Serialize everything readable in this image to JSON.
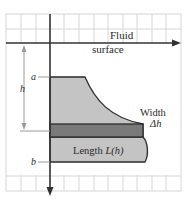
{
  "diagram": {
    "surface_label_line1": "Fluid",
    "surface_label_line2": "surface",
    "depth_top_label": "a",
    "depth_bottom_label": "b",
    "depth_label": "h",
    "width_label_line1": "Width",
    "width_label_line2": "Δh",
    "length_label": "Length L(h)",
    "length_label_prefix": "Length ",
    "length_label_func": "L(h)"
  },
  "colors": {
    "grid": "#d6d6d6",
    "axis": "#333333",
    "plate_fill": "#c4c4c4",
    "strip_fill": "#7a7a7a",
    "outline": "#2b2b2b",
    "guide": "#9a9a9a"
  }
}
